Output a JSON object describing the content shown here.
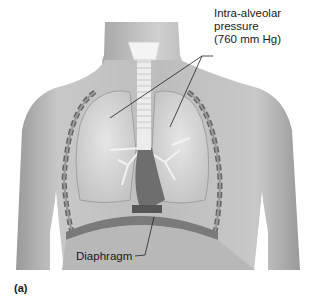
{
  "figure": {
    "labels": {
      "intra_alveolar_line1": "Intra-alveolar",
      "intra_alveolar_line2": "pressure",
      "intra_alveolar_line3": "(760 mm Hg)",
      "diaphragm": "Diaphragm"
    },
    "panel_label": "(a)"
  }
}
